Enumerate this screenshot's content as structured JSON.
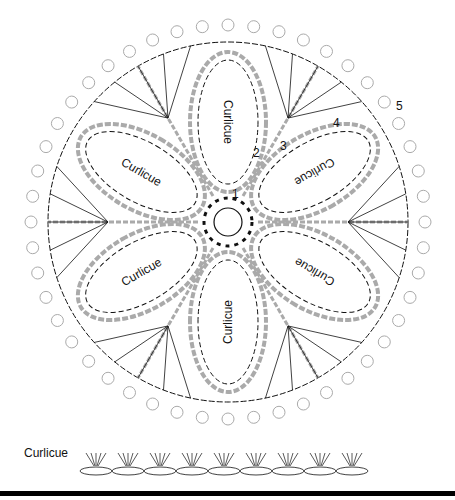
{
  "diagram": {
    "type": "crochet-chart",
    "center": [
      228,
      222
    ],
    "outer_radius": 205,
    "petal_label": "Curlicue",
    "petal_count": 6,
    "round_labels": [
      {
        "text": "1",
        "x": 232,
        "y": 198
      },
      {
        "text": "2",
        "x": 253,
        "y": 157
      },
      {
        "text": "3",
        "x": 280,
        "y": 150
      },
      {
        "text": "4",
        "x": 333,
        "y": 127
      },
      {
        "text": "5",
        "x": 396,
        "y": 110
      }
    ],
    "colors": {
      "ink": "#111111",
      "grey": "#aaaaaa",
      "bar": "#000000"
    }
  },
  "legend": {
    "label": "Curlicue",
    "motif_repeats": 9
  }
}
